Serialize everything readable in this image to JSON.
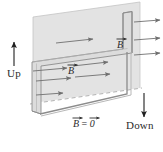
{
  "figure": {
    "width": 163,
    "height": 152,
    "background_color": "#ffffff"
  },
  "colors": {
    "field_region_fill": "#e3e3e3",
    "field_region_edge": "#b9b9b9",
    "wire_stroke": "#8c8c8c",
    "wire_highlight": "#d8d8d8",
    "arrow_color": "#6f6f6f",
    "direction_arrow_color": "#1f1f1f",
    "text_color": "#2b2b2b",
    "dashed_edge_color": "#a8a8a8"
  },
  "labels": {
    "up": "Up",
    "down": "Down",
    "b_field_upper": "B",
    "b_field_middle": "B",
    "b_zero": "B = 0"
  },
  "label_parts": {
    "b_symbol": "B",
    "equals": "=",
    "zero_symbol": "0"
  },
  "annotations": {
    "direction_arrows": [
      {
        "name": "up-arrow",
        "label": "Up",
        "direction": "up"
      },
      {
        "name": "down-arrow",
        "label": "Down",
        "direction": "down"
      }
    ],
    "field_arrow_count_inside": 6,
    "field_arrow_count_outside": 3,
    "field_arrow_direction": "right",
    "field_region_description": "Shaded plane above the dashed boundary contains the magnetic field",
    "zero_field_description": "Region below the shaded plane has zero magnetic field"
  },
  "icons": {
    "up_arrow": "arrow-up-icon",
    "down_arrow": "arrow-down-icon",
    "field_arrow": "arrow-right-icon"
  }
}
